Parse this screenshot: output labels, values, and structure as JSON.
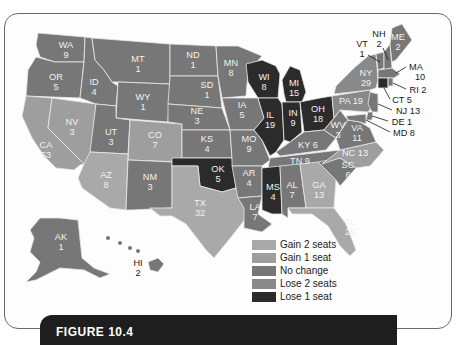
{
  "figure": {
    "caption_label": "FIGURE 10.4"
  },
  "legend": {
    "items": [
      {
        "key": "gain2",
        "label": "Gain 2 seats",
        "color": "#a9a9a9"
      },
      {
        "key": "gain1",
        "label": "Gain 1 seat",
        "color": "#9e9e9e"
      },
      {
        "key": "nochange",
        "label": "No change",
        "color": "#777777"
      },
      {
        "key": "lose2",
        "label": "Lose 2 seats",
        "color": "#898989"
      },
      {
        "key": "lose1",
        "label": "Lose 1 seat",
        "color": "#2b2b2b"
      }
    ]
  },
  "states": {
    "WA": {
      "abbr": "WA",
      "seats": "9",
      "category": "nochange"
    },
    "OR": {
      "abbr": "OR",
      "seats": "5",
      "category": "nochange"
    },
    "CA": {
      "abbr": "CA",
      "seats": "53",
      "category": "gain1"
    },
    "NV": {
      "abbr": "NV",
      "seats": "3",
      "category": "gain1"
    },
    "ID": {
      "abbr": "ID",
      "seats": "4",
      "category": "nochange"
    },
    "MT": {
      "abbr": "MT",
      "seats": "1",
      "category": "nochange"
    },
    "WY": {
      "abbr": "WY",
      "seats": "1",
      "category": "nochange"
    },
    "UT": {
      "abbr": "UT",
      "seats": "3",
      "category": "nochange"
    },
    "CO": {
      "abbr": "CO",
      "seats": "7",
      "category": "gain1"
    },
    "AZ": {
      "abbr": "AZ",
      "seats": "8",
      "category": "gain2"
    },
    "NM": {
      "abbr": "NM",
      "seats": "3",
      "category": "nochange"
    },
    "ND": {
      "abbr": "ND",
      "seats": "1",
      "category": "nochange"
    },
    "SD": {
      "abbr": "SD",
      "seats": "1",
      "category": "nochange"
    },
    "NE": {
      "abbr": "NE",
      "seats": "3",
      "category": "nochange"
    },
    "KS": {
      "abbr": "KS",
      "seats": "4",
      "category": "nochange"
    },
    "OK": {
      "abbr": "OK",
      "seats": "5",
      "category": "lose1"
    },
    "TX": {
      "abbr": "TX",
      "seats": "32",
      "category": "gain2"
    },
    "MN": {
      "abbr": "MN",
      "seats": "8",
      "category": "nochange"
    },
    "IA": {
      "abbr": "IA",
      "seats": "5",
      "category": "nochange"
    },
    "MO": {
      "abbr": "MO",
      "seats": "9",
      "category": "nochange"
    },
    "AR": {
      "abbr": "AR",
      "seats": "4",
      "category": "nochange"
    },
    "LA": {
      "abbr": "LA",
      "seats": "7",
      "category": "nochange"
    },
    "WI": {
      "abbr": "WI",
      "seats": "8",
      "category": "lose1"
    },
    "IL": {
      "abbr": "IL",
      "seats": "19",
      "category": "lose1"
    },
    "MI": {
      "abbr": "MI",
      "seats": "15",
      "category": "lose1"
    },
    "IN": {
      "abbr": "IN",
      "seats": "9",
      "category": "lose1"
    },
    "OH": {
      "abbr": "OH",
      "seats": "18",
      "category": "lose1"
    },
    "KY": {
      "abbr": "KY",
      "seats": "6",
      "category": "nochange"
    },
    "TN": {
      "abbr": "TN",
      "seats": "9",
      "category": "nochange"
    },
    "MS": {
      "abbr": "MS",
      "seats": "4",
      "category": "lose1"
    },
    "AL": {
      "abbr": "AL",
      "seats": "7",
      "category": "nochange"
    },
    "GA": {
      "abbr": "GA",
      "seats": "13",
      "category": "gain2"
    },
    "FL": {
      "abbr": "FL",
      "seats": "25",
      "category": "gain2"
    },
    "SC": {
      "abbr": "SC",
      "seats": "6",
      "category": "nochange"
    },
    "NC": {
      "abbr": "NC",
      "seats": "13",
      "category": "gain1"
    },
    "VA": {
      "abbr": "VA",
      "seats": "11",
      "category": "nochange"
    },
    "WV": {
      "abbr": "WV",
      "seats": "3",
      "category": "nochange"
    },
    "PA": {
      "abbr": "PA",
      "seats": "19",
      "category": "lose2"
    },
    "NY": {
      "abbr": "NY",
      "seats": "29",
      "category": "lose2"
    },
    "VT": {
      "abbr": "VT",
      "seats": "1",
      "category": "nochange"
    },
    "NH": {
      "abbr": "NH",
      "seats": "2",
      "category": "nochange"
    },
    "ME": {
      "abbr": "ME",
      "seats": "2",
      "category": "nochange"
    },
    "MA": {
      "abbr": "MA",
      "seats": "10",
      "category": "nochange"
    },
    "RI": {
      "abbr": "RI",
      "seats": "2",
      "category": "nochange"
    },
    "CT": {
      "abbr": "CT",
      "seats": "5",
      "category": "lose1"
    },
    "NJ": {
      "abbr": "NJ",
      "seats": "13",
      "category": "nochange"
    },
    "DE": {
      "abbr": "DE",
      "seats": "1",
      "category": "nochange"
    },
    "MD": {
      "abbr": "MD",
      "seats": "8",
      "category": "nochange"
    },
    "AK": {
      "abbr": "AK",
      "seats": "1",
      "category": "nochange"
    },
    "HI": {
      "abbr": "HI",
      "seats": "2",
      "category": "nochange"
    }
  },
  "callouts": {
    "VT": "VT",
    "VT_seats": "1",
    "NH": "NH",
    "NH_seats": "2",
    "MA": "MA",
    "MA_seats": "10",
    "RI": "RI 2",
    "CT": "CT 5",
    "NJ": "NJ 13",
    "DE": "DE 1",
    "MD": "MD 8",
    "PA": "PA 19",
    "KY": "KY 6",
    "TN": "TN 9",
    "NC": "NC 13"
  }
}
